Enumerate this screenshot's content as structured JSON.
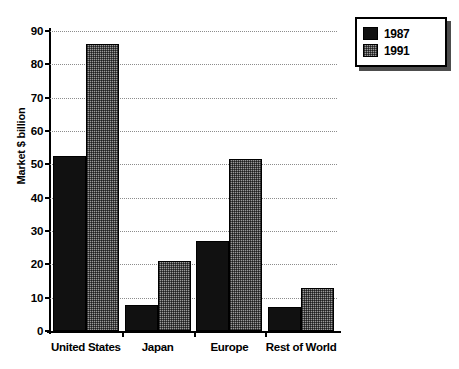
{
  "chart_data": {
    "type": "bar",
    "title": "",
    "xlabel": "",
    "ylabel": "Market $ billion",
    "ylim": [
      0,
      90
    ],
    "ytick_step": 10,
    "yticks": [
      "0",
      "10",
      "20",
      "30",
      "40",
      "50",
      "60",
      "70",
      "80",
      "90"
    ],
    "grid": true,
    "legend_position": "top-right",
    "categories": [
      "United States",
      "Japan",
      "Europe",
      "Rest of World"
    ],
    "series": [
      {
        "name": "1987",
        "color": "#111111",
        "pattern": "solid-black",
        "values": [
          52.5,
          7.7,
          27,
          7.3
        ]
      },
      {
        "name": "1991",
        "color": "#9a9a9a",
        "pattern": "checkered-gray",
        "values": [
          86,
          21,
          51.5,
          13
        ]
      }
    ]
  },
  "legend": {
    "entries": [
      {
        "label": "1987",
        "swatch": "solid-black-swatch"
      },
      {
        "label": "1991",
        "swatch": "checkered-gray-swatch"
      }
    ]
  }
}
